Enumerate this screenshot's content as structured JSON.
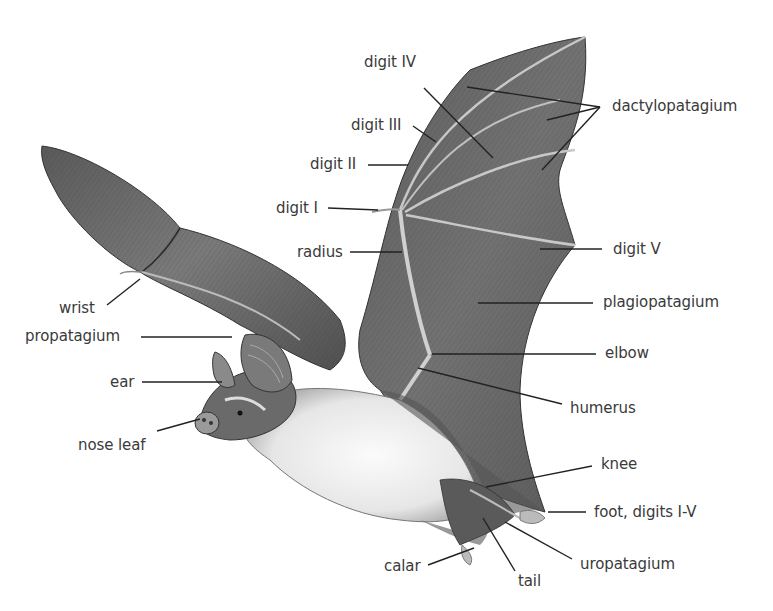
{
  "colors": {
    "background": "#ffffff",
    "label_text": "#3a3a3a",
    "leader_line": "#222222",
    "wing_membrane_dark": "#4a4a4a",
    "wing_membrane_mid": "#6e6e6e",
    "wing_membrane_light": "#8c8c8c",
    "bone": "#c8c8c8",
    "belly_fur": "#f2f2f2"
  },
  "labels": {
    "digit_iv": "digit IV",
    "digit_iii": "digit III",
    "digit_ii": "digit II",
    "digit_i": "digit I",
    "radius": "radius",
    "dactylopatagium": "dactylopatagium",
    "digit_v": "digit V",
    "plagiopatagium": "plagiopatagium",
    "elbow": "elbow",
    "humerus": "humerus",
    "wrist": "wrist",
    "propatagium": "propatagium",
    "ear": "ear",
    "nose_leaf": "nose leaf",
    "knee": "knee",
    "foot": "foot, digits I-V",
    "calar": "calar",
    "tail": "tail",
    "uropatagium": "uropatagium"
  }
}
